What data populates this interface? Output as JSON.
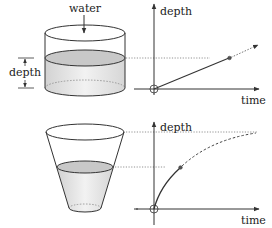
{
  "top": {
    "container": "cylinder",
    "inflow_label": "water",
    "depth_bracket_label": "depth",
    "graph": {
      "y_axis_label": "depth",
      "x_axis_label": "time",
      "curve": "linear"
    }
  },
  "bottom": {
    "container": "tapered-cup",
    "graph": {
      "y_axis_label": "depth",
      "x_axis_label": "time",
      "curve": "concave-saturating"
    }
  },
  "colors": {
    "line": "#333333",
    "water_fill": "#dcdcdc",
    "water_surface": "#c8c8c8",
    "dotted": "#777777"
  }
}
